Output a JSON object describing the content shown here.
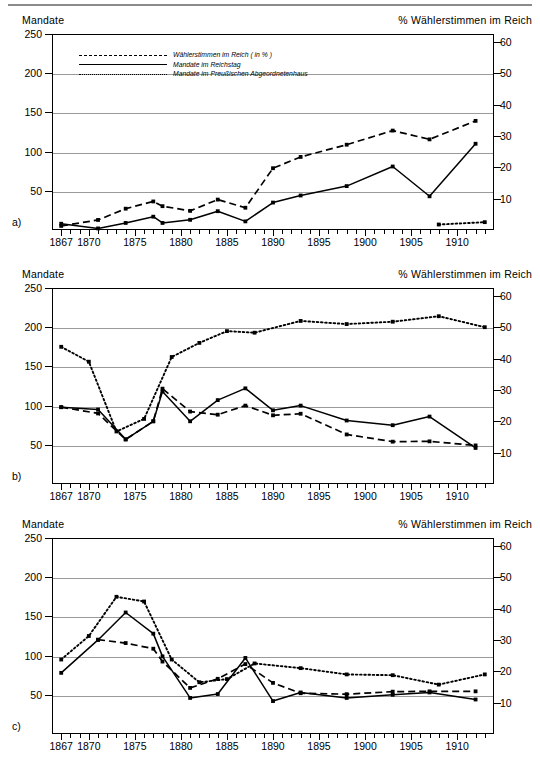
{
  "figure": {
    "top_rule": true,
    "axis_title_left": "Mandate",
    "axis_title_right": "% Wählerstimmen im Reich",
    "legend": [
      {
        "style": "dashed",
        "label": "Wählerstimmen im Reich ( in % )"
      },
      {
        "style": "solid",
        "label": "Mandate im Reichstag"
      },
      {
        "style": "dotted",
        "label": "Mandate im Preußischen Abgeordnetenhaus"
      }
    ],
    "panel_letters": {
      "a": "a)",
      "b": "b)",
      "c": "c)"
    }
  },
  "axes": {
    "y_left_ticks": [
      "250",
      "200",
      "150",
      "100",
      "50"
    ],
    "y_left_values": [
      250,
      200,
      150,
      100,
      50
    ],
    "y_right_ticks": [
      "60",
      "50",
      "40",
      "30",
      "20",
      "10"
    ],
    "y_right_values": [
      60,
      50,
      40,
      30,
      20,
      10
    ],
    "x_labels": [
      "1867",
      "1870",
      "1875",
      "1880",
      "1885",
      "1890",
      "1895",
      "1900",
      "1905",
      "1910"
    ],
    "x_label_values": [
      1867,
      1870,
      1875,
      1880,
      1885,
      1890,
      1895,
      1900,
      1905,
      1910
    ],
    "xlim": [
      1866,
      1914
    ],
    "ylim_left": [
      0,
      250
    ],
    "ylim_right": [
      0,
      62.5
    ],
    "grid": "horizontal"
  },
  "chart_data": [
    {
      "id": "a",
      "type": "line",
      "title": "",
      "xlabel": "",
      "ylabel": "Mandate",
      "ylabel_right": "% Wählerstimmen im Reich",
      "xlim": [
        1866,
        1914
      ],
      "ylim": [
        0,
        250
      ],
      "ylim_right": [
        0,
        62.5
      ],
      "grid": true,
      "legend_position": "top-left",
      "series": [
        {
          "name": "Wählerstimmen im Reich ( in % )",
          "style": "dashed",
          "axis": "right",
          "x": [
            1867,
            1871,
            1874,
            1877,
            1878,
            1881,
            1884,
            1887,
            1890,
            1893,
            1898,
            1903,
            1907,
            1912
          ],
          "values": [
            1.3,
            3.2,
            6.8,
            9.1,
            7.6,
            6.1,
            9.7,
            7.1,
            19.7,
            23.3,
            27.2,
            31.7,
            28.9,
            34.8
          ]
        },
        {
          "name": "Mandate im Reichstag",
          "style": "solid",
          "axis": "left",
          "x": [
            1867,
            1871,
            1874,
            1877,
            1878,
            1881,
            1884,
            1887,
            1890,
            1893,
            1898,
            1903,
            1907,
            1912
          ],
          "values": [
            8,
            2,
            9,
            17,
            9,
            13,
            24,
            11,
            35,
            44,
            56,
            81,
            43,
            110
          ]
        },
        {
          "name": "Mandate im Preußischen Abgeordnetenhaus",
          "style": "dotted",
          "axis": "left",
          "x": [
            1908,
            1913
          ],
          "values": [
            7,
            10
          ]
        }
      ]
    },
    {
      "id": "b",
      "type": "line",
      "title": "",
      "xlabel": "",
      "ylabel": "Mandate",
      "ylabel_right": "% Wählerstimmen im Reich",
      "xlim": [
        1866,
        1914
      ],
      "ylim": [
        0,
        250
      ],
      "ylim_right": [
        0,
        62.5
      ],
      "grid": true,
      "legend_position": "none",
      "series": [
        {
          "name": "Wählerstimmen im Reich ( in % )",
          "style": "dashed",
          "axis": "right",
          "x": [
            1867,
            1871,
            1874,
            1877,
            1878,
            1881,
            1884,
            1887,
            1890,
            1893,
            1898,
            1903,
            1907,
            1912
          ],
          "values": [
            24.5,
            22.5,
            14.2,
            20.0,
            30.4,
            23.1,
            22.1,
            25.0,
            21.9,
            22.4,
            15.8,
            13.5,
            13.6,
            12.3
          ]
        },
        {
          "name": "Mandate im Reichstag",
          "style": "solid",
          "axis": "left",
          "x": [
            1867,
            1871,
            1874,
            1877,
            1878,
            1881,
            1884,
            1887,
            1890,
            1893,
            1898,
            1903,
            1907,
            1912
          ],
          "values": [
            98,
            95,
            57,
            80,
            118,
            80,
            107,
            122,
            94,
            100,
            81,
            75,
            86,
            46
          ]
        },
        {
          "name": "Mandate im Preußischen Abgeordnetenhaus",
          "style": "dotted",
          "axis": "left",
          "x": [
            1867,
            1870,
            1873,
            1876,
            1879,
            1882,
            1885,
            1888,
            1893,
            1898,
            1903,
            1908,
            1913
          ],
          "values": [
            175,
            156,
            67,
            83,
            162,
            180,
            195,
            193,
            208,
            204,
            207,
            214,
            200
          ]
        }
      ]
    },
    {
      "id": "c",
      "type": "line",
      "title": "",
      "xlabel": "",
      "ylabel": "Mandate",
      "ylabel_right": "% Wählerstimmen im Reich",
      "xlim": [
        1866,
        1914
      ],
      "ylim": [
        0,
        250
      ],
      "ylim_right": [
        0,
        62.5
      ],
      "grid": true,
      "legend_position": "none",
      "series": [
        {
          "name": "Wählerstimmen im Reich ( in % )",
          "style": "dashed",
          "axis": "right",
          "x": [
            1867,
            1871,
            1874,
            1877,
            1878,
            1881,
            1884,
            1887,
            1890,
            1893,
            1898,
            1903,
            1907,
            1912
          ],
          "values": [
            null,
            30.1,
            29.0,
            27.2,
            23.1,
            14.7,
            17.6,
            22.3,
            16.3,
            13.0,
            12.7,
            13.5,
            13.6,
            13.6
          ]
        },
        {
          "name": "Mandate im Reichstag",
          "style": "solid",
          "axis": "left",
          "x": [
            1867,
            1871,
            1874,
            1877,
            1878,
            1881,
            1884,
            1887,
            1890,
            1893,
            1898,
            1903,
            1907,
            1912
          ],
          "values": [
            78,
            120,
            155,
            128,
            99,
            46,
            51,
            97,
            42,
            53,
            46,
            50,
            53,
            44
          ]
        },
        {
          "name": "Mandate im Preußischen Abgeordnetenhaus",
          "style": "dotted",
          "axis": "left",
          "x": [
            1867,
            1870,
            1873,
            1876,
            1879,
            1882,
            1885,
            1888,
            1893,
            1898,
            1903,
            1908,
            1913
          ],
          "values": [
            95,
            125,
            175,
            169,
            95,
            66,
            70,
            90,
            84,
            76,
            75,
            63,
            76
          ]
        }
      ]
    }
  ]
}
